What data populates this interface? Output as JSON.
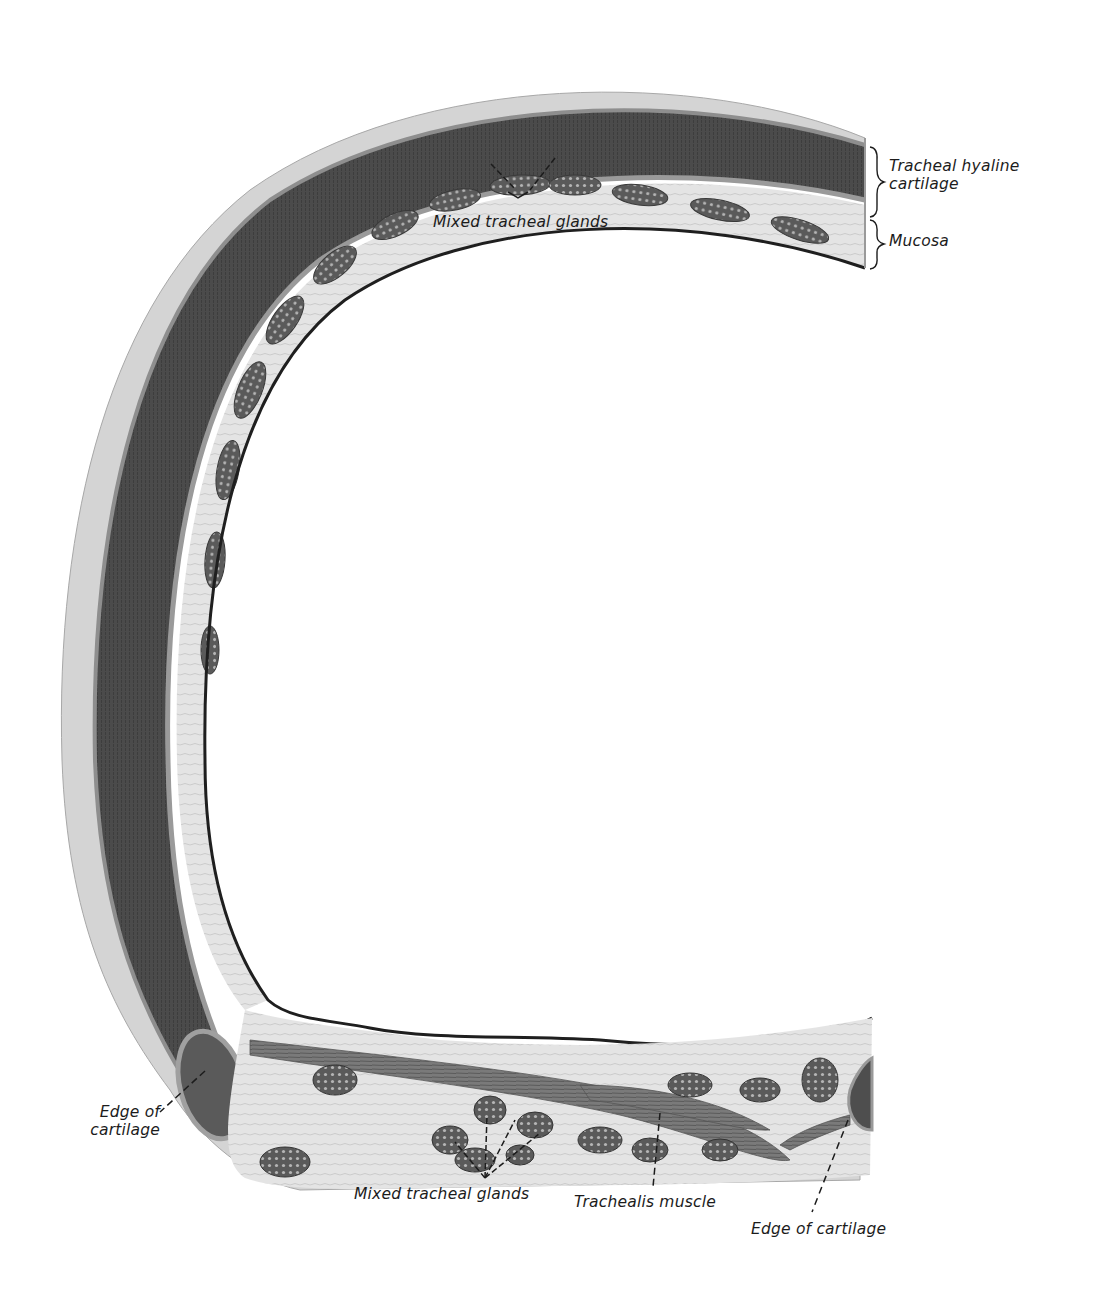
{
  "figure": {
    "colors": {
      "background": "#ffffff",
      "perichondrium": "#c9c9c9",
      "cartilage_dark": "#4a4a4a",
      "cartilage_light": "#8a8a8a",
      "submucosa": "#d6d6d6",
      "gland": "#5e5e5e",
      "muscle": "#6e6e6e",
      "epithelium_edge": "#202020",
      "leader_line": "#1c1c1c"
    }
  },
  "labels": {
    "tracheal_hyaline_cartilage": {
      "line1": "Tracheal hyaline",
      "line2": "cartilage"
    },
    "mucosa": {
      "text": "Mucosa"
    },
    "mixed_tracheal_glands_top": {
      "text": "Mixed tracheal glands"
    },
    "edge_of_cartilage_left": {
      "line1": "Edge of",
      "line2": "cartilage"
    },
    "mixed_tracheal_glands_bottom": {
      "text": "Mixed tracheal glands"
    },
    "trachealis_muscle": {
      "text": "Trachealis muscle"
    },
    "edge_of_cartilage_right": {
      "text": "Edge of cartilage"
    }
  }
}
